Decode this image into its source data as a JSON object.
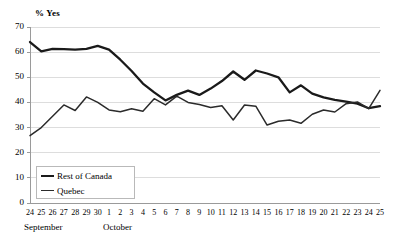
{
  "chart_data": {
    "type": "line",
    "title": "",
    "subtitle": "",
    "ylabel": "% Yes",
    "xlabel": "",
    "ylim": [
      0,
      70
    ],
    "yticks": [
      0,
      10,
      20,
      30,
      40,
      50,
      60,
      70
    ],
    "grid": true,
    "legend_position": "bottom-left",
    "x": [
      "24",
      "25",
      "26",
      "27",
      "28",
      "29",
      "30",
      "1",
      "2",
      "3",
      "4",
      "5",
      "6",
      "7",
      "8",
      "9",
      "10",
      "11",
      "12",
      "13",
      "14",
      "15",
      "16",
      "17",
      "18",
      "19",
      "20",
      "21",
      "22",
      "23",
      "24",
      "25"
    ],
    "x_group_labels": [
      {
        "label": "September",
        "start_index": 0
      },
      {
        "label": "October",
        "start_index": 7
      }
    ],
    "series": [
      {
        "name": "Rest of Canada",
        "values": [
          64,
          60.3,
          61.3,
          61.2,
          61,
          61.3,
          62.5,
          61,
          57,
          52.5,
          47.5,
          44,
          40.8,
          43,
          44.7,
          43,
          45.5,
          48.5,
          52.3,
          49,
          52.7,
          51.5,
          50,
          44,
          46.8,
          43.5,
          42,
          41,
          40.3,
          39.5,
          37.7,
          38.5
        ]
      },
      {
        "name": "Quebec",
        "values": [
          26.8,
          30,
          34.5,
          39,
          36.8,
          42.2,
          40,
          37,
          36.3,
          37.5,
          36.5,
          41.5,
          39,
          42.5,
          40,
          39.2,
          38,
          38.7,
          33,
          39,
          38.5,
          31,
          32.5,
          33,
          31.7,
          35.3,
          37,
          36.2,
          39.5,
          40.2,
          37.5,
          44.8
        ]
      }
    ]
  },
  "axis": {
    "y_title": "% Yes"
  },
  "legend": {
    "entries": [
      {
        "label": "Rest of Canada",
        "marker": "thick-line"
      },
      {
        "label": "Quebec",
        "marker": "thin-line"
      }
    ]
  },
  "colors": {
    "series_rest_of_canada": "#1a1a1a",
    "series_quebec": "#2b2b2b",
    "gridline": "#d9d9d9",
    "axis": "#9a9a9a",
    "text": "#000000"
  }
}
